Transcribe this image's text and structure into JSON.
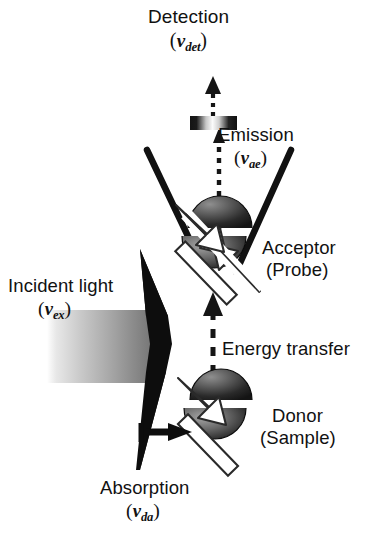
{
  "figure": {
    "type": "fret-microscopy-schematic",
    "background_color": "#ffffff",
    "ink_color": "#111111"
  },
  "labels": {
    "detection": {
      "line1": "Detection",
      "symbol": "ν",
      "subscript": "det",
      "line2_open": "(",
      "line2_close": ")"
    },
    "emission": {
      "line1": "Emission",
      "symbol": "ν",
      "subscript": "ae",
      "line2_open": "(",
      "line2_close": ")"
    },
    "incident": {
      "line1": "Incident light",
      "symbol": "ν",
      "subscript": "ex",
      "line2_open": "(",
      "line2_close": ")"
    },
    "absorption": {
      "line1": "Absorption",
      "symbol": "ν",
      "subscript": "da",
      "line2_open": "(",
      "line2_close": ")"
    },
    "energy_transfer": {
      "line1": "Energy transfer"
    },
    "acceptor": {
      "line1": "Acceptor",
      "line2": "(Probe)"
    },
    "donor": {
      "line1": "Donor",
      "line2": "(Sample)"
    }
  },
  "elements": {
    "detector_arrow": "dotted-arrow-up",
    "emission_filter": "filter-bar",
    "collection_cone": "v-shaped-objective",
    "acceptor_sphere": "shaded-sphere-with-transition-arrow",
    "donor_sphere": "shaded-sphere-with-transition-arrow",
    "energy_transfer_arrow": "dashed-arrow-up",
    "excitation_beam": "gradient-beam",
    "excitation_prism": "black-wedge",
    "absorption_arrow": "solid-arrow-right"
  }
}
